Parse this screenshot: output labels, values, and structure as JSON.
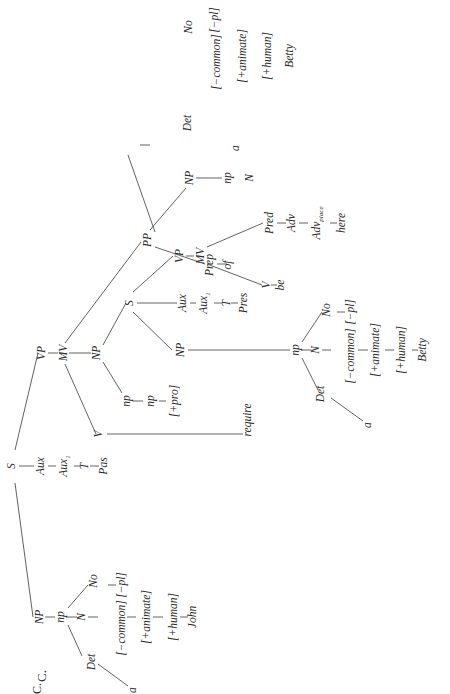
{
  "figure_label": "C.",
  "orientation": "rotated-90-ccw",
  "nodes": {
    "S_root": "S",
    "NP_subj": "NP",
    "np_subj": "np",
    "Det_subj": "Det",
    "a_subj": "a",
    "N_subj": "N",
    "No_subj": "No",
    "common_subj": "[−common]",
    "pl_subj": "[−pl]",
    "animate_subj": "[+animate]",
    "human_subj": "[+human]",
    "john": "John",
    "Aux_main": "Aux",
    "Aux1_main": "Aux",
    "Aux1_main_sub": "1",
    "T_main": "T",
    "Pas": "Pas",
    "VP_main": "VP",
    "MV_main": "MV",
    "V_main": "V",
    "require": "require",
    "NP_obj": "NP",
    "np_pro": "np",
    "np_pro2": "np",
    "pro": "[+pro]",
    "S_emb": "S",
    "NP_emb": "NP",
    "np_emb": "np",
    "Det_emb": "Det",
    "a_emb": "a",
    "N_emb": "N",
    "No_emb": "No",
    "common_emb": "[−common]",
    "pl_emb": "[−pl]",
    "animate_emb": "[+animate]",
    "human_emb": "[+human]",
    "betty_emb": "Betty",
    "Aux_emb": "Aux",
    "Aux1_emb": "Aux",
    "Aux1_emb_sub": "1",
    "T_emb": "T",
    "Pres": "Pres",
    "VP_emb": "VP",
    "MV_emb": "MV",
    "V_emb": "V",
    "be": "be",
    "Pred": "Pred",
    "Adv": "Adv",
    "Adv_place": "Adv",
    "Adv_place_sub": "place",
    "here": "here",
    "PP": "PP",
    "Prep": "Prep",
    "of": "of",
    "NP_pp": "NP",
    "np_pp": "np",
    "Det_pp": "Det",
    "a_pp": "a",
    "N_pp": "N",
    "No_pp": "No",
    "common_pp": "[−common]",
    "pl_pp": "[−pl]",
    "animate_pp": "[+animate]",
    "human_pp": "[+human]",
    "betty_pp": "Betty"
  }
}
